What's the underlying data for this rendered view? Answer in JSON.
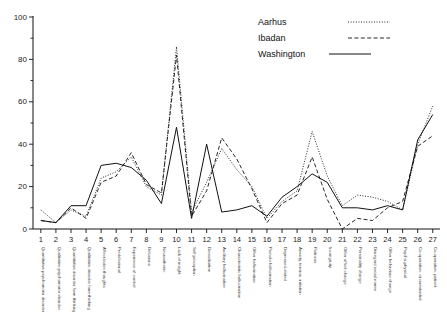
{
  "legend": {
    "position": "top-right",
    "entries": [
      {
        "label": "Aarhus",
        "style": "dotted"
      },
      {
        "label": "Ibadan",
        "style": "dashed"
      },
      {
        "label": "Washington",
        "style": "solid"
      }
    ]
  },
  "axes": {
    "y_ticks": [
      "0",
      "20",
      "40",
      "60",
      "80",
      "100"
    ],
    "y_minor_ticks": [
      "10",
      "30",
      "50",
      "70",
      "90"
    ],
    "x_numbers": [
      "1",
      "2",
      "3",
      "4",
      "5",
      "6",
      "7",
      "8",
      "9",
      "10",
      "11",
      "12",
      "13",
      "14",
      "15",
      "16",
      "17",
      "18",
      "19",
      "20",
      "21",
      "22",
      "23",
      "24",
      "25",
      "26",
      "27"
    ]
  },
  "chart_data": {
    "type": "line",
    "title": "",
    "xlabel": "",
    "ylabel": "",
    "ylim": [
      0,
      100
    ],
    "grid": false,
    "legend_position": "top-right",
    "categories": [
      "Quantitative psychomotor disorder",
      "Qualitative psychomotor disorder",
      "Quantitative disorder form thinking",
      "Qualitative disorder form thinking",
      "Affect-laden thoughts",
      "Predelusional",
      "Experience of control",
      "Delusions",
      "Neurasthenic",
      "Lack of insight",
      "Self perception",
      "Derealisation",
      "Auditory hallucination",
      "Characteristic hallucination",
      "Other hallucination",
      "Pseudo hallucination",
      "Depressed-elated",
      "Anxiety, tension, irritation",
      "Flatness",
      "Incongruity",
      "Other affect change",
      "Personality change",
      "Disregard social norms",
      "Other behaviour change",
      "Psycho-physical",
      "Co-operation, circumstantial",
      "Co-operation, patient"
    ],
    "x": [
      1,
      2,
      3,
      4,
      5,
      6,
      7,
      8,
      9,
      10,
      11,
      12,
      13,
      14,
      15,
      16,
      17,
      18,
      19,
      20,
      21,
      22,
      23,
      24,
      25,
      26,
      27
    ],
    "series": [
      {
        "name": "Aarhus",
        "style": "dotted",
        "values": [
          9,
          3,
          9,
          6,
          24,
          27,
          34,
          20,
          16,
          86,
          8,
          22,
          38,
          28,
          20,
          5,
          13,
          18,
          46,
          25,
          11,
          16,
          15,
          13,
          9,
          40,
          58
        ]
      },
      {
        "name": "Ibadan",
        "style": "dashed",
        "values": [
          4,
          3,
          10,
          5,
          22,
          25,
          36,
          21,
          17,
          82,
          6,
          18,
          43,
          33,
          19,
          3,
          12,
          16,
          34,
          14,
          0,
          5,
          4,
          10,
          13,
          39,
          44
        ]
      },
      {
        "name": "Washington",
        "style": "solid",
        "values": [
          4,
          3,
          11,
          11,
          30,
          31,
          29,
          23,
          12,
          48,
          5,
          40,
          8,
          9,
          11,
          6,
          15,
          20,
          26,
          22,
          10,
          10,
          9,
          11,
          9,
          42,
          54
        ]
      }
    ]
  }
}
